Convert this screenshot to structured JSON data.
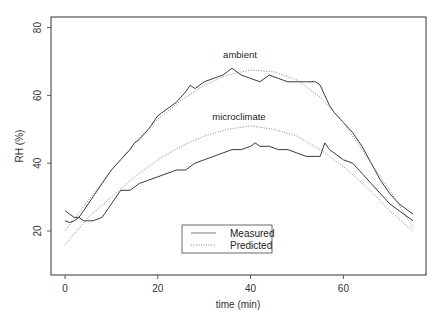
{
  "chart_data": {
    "type": "line",
    "title": "",
    "xlabel": "time (min)",
    "ylabel": "RH (%)",
    "xlim": [
      -3,
      78
    ],
    "ylim": [
      7,
      83
    ],
    "xticks": [
      0,
      20,
      40,
      60
    ],
    "yticks": [
      20,
      40,
      60,
      80
    ],
    "grid": false,
    "legend": {
      "position": "bottom-center",
      "entries": [
        {
          "label": "Measured",
          "style": "solid"
        },
        {
          "label": "Predicted",
          "style": "dotted"
        }
      ]
    },
    "annotations": [
      {
        "text": "ambient",
        "x": 40,
        "y": 71
      },
      {
        "text": "microclimate",
        "x": 40,
        "y": 53
      }
    ],
    "series": [
      {
        "name": "ambient measured",
        "group": "ambient",
        "style": "solid",
        "x": [
          0,
          1,
          2,
          3,
          4,
          5,
          6,
          8,
          10,
          12,
          14,
          15,
          16,
          18,
          20,
          22,
          24,
          26,
          27,
          28,
          30,
          32,
          34,
          35,
          36,
          38,
          40,
          42,
          44,
          46,
          48,
          50,
          52,
          54,
          55,
          56,
          57,
          58,
          60,
          62,
          64,
          66,
          68,
          70,
          72,
          74,
          75
        ],
        "y": [
          23,
          22.5,
          23,
          24,
          26,
          28,
          30,
          34,
          38,
          41,
          44,
          46,
          47,
          50,
          54,
          56,
          58,
          61,
          63,
          62,
          64,
          65,
          66,
          67,
          68,
          66,
          65,
          64,
          66,
          65,
          64,
          64,
          64,
          64,
          63,
          60,
          57,
          55,
          52,
          49,
          45,
          40,
          35,
          31,
          28,
          26,
          25
        ]
      },
      {
        "name": "ambient predicted",
        "group": "ambient",
        "style": "dotted",
        "x": [
          0,
          5,
          10,
          15,
          20,
          25,
          30,
          35,
          40,
          45,
          50,
          55,
          60,
          65,
          70,
          75
        ],
        "y": [
          20,
          29,
          38,
          46,
          53,
          58.5,
          63,
          66,
          67.5,
          67,
          64.5,
          59.5,
          52,
          42,
          32,
          21
        ]
      },
      {
        "name": "microclimate measured",
        "group": "microclimate",
        "style": "solid",
        "x": [
          0,
          1,
          2,
          3,
          4,
          5,
          6,
          8,
          10,
          11,
          12,
          14,
          16,
          18,
          20,
          22,
          24,
          26,
          28,
          30,
          32,
          34,
          36,
          38,
          40,
          41,
          42,
          44,
          46,
          48,
          50,
          52,
          54,
          55,
          56,
          57,
          58,
          60,
          62,
          64,
          66,
          68,
          70,
          72,
          75
        ],
        "y": [
          26,
          25,
          24,
          24,
          23,
          23,
          23,
          24,
          28,
          30,
          32,
          32,
          34,
          35,
          36,
          37,
          38,
          38,
          40,
          41,
          42,
          43,
          44,
          44,
          45,
          46,
          45,
          45,
          44,
          44,
          43,
          42,
          42,
          42,
          46,
          44,
          43,
          41,
          40,
          37,
          34,
          31,
          28,
          26,
          23
        ]
      },
      {
        "name": "microclimate predicted",
        "group": "microclimate",
        "style": "dotted",
        "x": [
          0,
          5,
          10,
          15,
          20,
          25,
          30,
          35,
          40,
          45,
          50,
          55,
          60,
          65,
          70,
          75
        ],
        "y": [
          16,
          24,
          30,
          36,
          41,
          45,
          48,
          50,
          51,
          50,
          48,
          44,
          39,
          33,
          26,
          20
        ]
      }
    ]
  }
}
